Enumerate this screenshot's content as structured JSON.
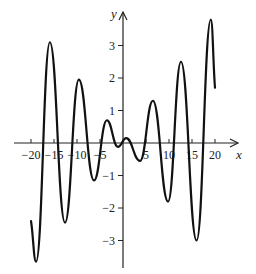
{
  "chart_data": {
    "type": "line",
    "title": "",
    "xlabel": "x",
    "ylabel": "y",
    "xlim": [
      -20,
      20
    ],
    "ylim": [
      -3.7,
      3.8
    ],
    "grid": false,
    "legend": null,
    "x_ticks": [
      -20,
      -15,
      -10,
      -5,
      5,
      10,
      15,
      20
    ],
    "x_tick_labels": [
      "−20",
      "−15",
      "−10",
      "−5",
      "5",
      "10",
      "15",
      "20"
    ],
    "y_ticks": [
      3,
      2,
      1,
      -1,
      -2,
      -3
    ],
    "y_tick_labels": [
      "3",
      "2",
      "1",
      "−1",
      "−2",
      "−3"
    ],
    "series": [
      {
        "name": "curve",
        "color": "#111111",
        "points": [
          [
            -20.0,
            -2.4
          ],
          [
            -18.9,
            -3.65
          ],
          [
            -15.9,
            3.1
          ],
          [
            -12.6,
            -2.45
          ],
          [
            -9.6,
            1.95
          ],
          [
            -6.3,
            -1.15
          ],
          [
            -3.5,
            0.7
          ],
          [
            -1.1,
            -0.12
          ],
          [
            0.7,
            0.15
          ],
          [
            3.7,
            -0.55
          ],
          [
            6.5,
            1.3
          ],
          [
            9.8,
            -1.8
          ],
          [
            12.6,
            2.5
          ],
          [
            16.0,
            -3.0
          ],
          [
            19.1,
            3.8
          ],
          [
            20.0,
            1.7
          ]
        ]
      }
    ]
  }
}
